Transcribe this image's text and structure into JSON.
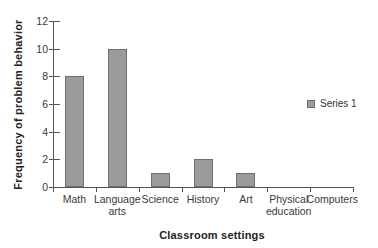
{
  "chart_data": {
    "type": "bar",
    "title": "",
    "xlabel": "Classroom settings",
    "ylabel": "Frequency of problem behavior",
    "categories": [
      "Math",
      "Language arts",
      "Science",
      "History",
      "Art",
      "Physical education",
      "Computers"
    ],
    "series": [
      {
        "name": "Series 1",
        "values": [
          8,
          10,
          1,
          2,
          1,
          0,
          0
        ]
      }
    ],
    "ylim": [
      0,
      12
    ],
    "yticks": [
      0,
      2,
      4,
      6,
      8,
      10,
      12
    ],
    "grid": false,
    "legend_position": "right",
    "colors": {
      "bar_fill": "#9b9b9b",
      "bar_border": "#6f6f6f",
      "axis_line": "#555555",
      "tick_text": "#3a3a3a",
      "title_text": "#222222",
      "background": "#ffffff"
    }
  }
}
